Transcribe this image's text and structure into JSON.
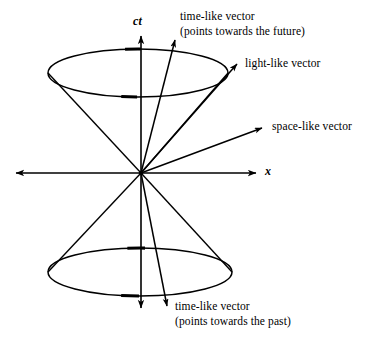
{
  "figure": {
    "background_color": "#ffffff",
    "stroke_color": "#000000"
  },
  "axes": {
    "vertical": {
      "label": "ct",
      "icon": "arrow-up-icon",
      "top_tip": [
        141,
        33
      ],
      "bottom_tip": [
        141,
        311
      ]
    },
    "horizontal": {
      "label": "x",
      "icon": "arrow-right-icon",
      "left_tip": [
        13,
        173
      ],
      "right_tip": [
        259,
        173
      ]
    },
    "origin": [
      141,
      173
    ]
  },
  "labels": {
    "timelike_future_line1": "time-like vector",
    "timelike_future_line2": "(points towards the future)",
    "lightlike": "light-like vector",
    "spacelike": "space-like vector",
    "timelike_past_line1": "time-like vector",
    "timelike_past_line2": "(points towards the past)"
  },
  "vectors": [
    {
      "name": "timelike-future-vector",
      "from": [
        141,
        173
      ],
      "to": [
        176,
        37
      ],
      "arrow": true
    },
    {
      "name": "lightlike-vector",
      "from": [
        141,
        173
      ],
      "to": [
        240,
        61
      ],
      "arrow": true
    },
    {
      "name": "spacelike-vector",
      "from": [
        141,
        173
      ],
      "to": [
        265,
        127
      ],
      "arrow": true
    },
    {
      "name": "timelike-past-vector",
      "from": [
        141,
        173
      ],
      "to": [
        168,
        309
      ],
      "arrow": true
    }
  ],
  "cones": {
    "upper": {
      "name": "future-light-cone",
      "ellipse_center": [
        138,
        73
      ],
      "ellipse_rx": 90,
      "ellipse_ry": 24,
      "left_generator_to": [
        48,
        73
      ],
      "right_generator_to": [
        228,
        73
      ]
    },
    "lower": {
      "name": "past-light-cone",
      "ellipse_center": [
        140,
        272
      ],
      "ellipse_rx": 92,
      "ellipse_ry": 24,
      "left_generator_to": [
        48,
        272
      ],
      "right_generator_to": [
        232,
        272
      ]
    }
  }
}
